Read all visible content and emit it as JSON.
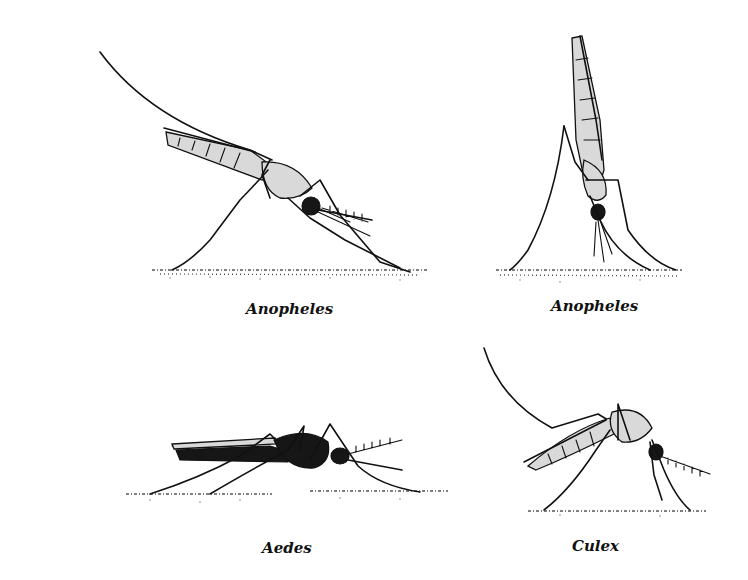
{
  "figure": {
    "panels": [
      {
        "id": "anopheles-side",
        "label": "Anopheles",
        "posture": "body angled to surface, resting side view"
      },
      {
        "id": "anopheles-vertical",
        "label": "Anopheles",
        "posture": "body nearly perpendicular to surface"
      },
      {
        "id": "aedes",
        "label": "Aedes",
        "posture": "body parallel to surface"
      },
      {
        "id": "culex",
        "label": "Culex",
        "posture": "body parallel to surface, hunched"
      }
    ]
  },
  "colors": {
    "ink": "#111111",
    "background": "#ffffff",
    "stipple": "#d9d9d9"
  }
}
